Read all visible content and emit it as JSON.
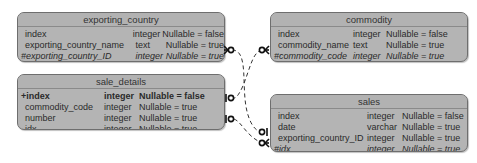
{
  "diagram": {
    "type": "entity-relationship",
    "tables": [
      {
        "name": "exporting_country",
        "columns": [
          {
            "name": "index",
            "type": "integer",
            "nullable": "Nullable = false",
            "style": "normal"
          },
          {
            "name": "exporting_country_name",
            "type": "text",
            "nullable": "Nullable = true",
            "style": "normal"
          },
          {
            "name": "#exporting_country_ID",
            "type": "integer",
            "nullable": "Nullable = true",
            "style": "italic"
          }
        ]
      },
      {
        "name": "sale_details",
        "columns": [
          {
            "name": "+index",
            "type": "integer",
            "nullable": "Nullable = false",
            "style": "bold"
          },
          {
            "name": "commodity_code",
            "type": "integer",
            "nullable": "Nullable = true",
            "style": "normal"
          },
          {
            "name": "number",
            "type": "integer",
            "nullable": "Nullable = true",
            "style": "normal"
          },
          {
            "name": "idx",
            "type": "integer",
            "nullable": "Nullable = true",
            "style": "normal"
          }
        ]
      },
      {
        "name": "commodity",
        "columns": [
          {
            "name": "index",
            "type": "integer",
            "nullable": "Nullable = false",
            "style": "normal"
          },
          {
            "name": "commodity_name",
            "type": "text",
            "nullable": "Nullable = true",
            "style": "normal"
          },
          {
            "name": "#commodity_code",
            "type": "integer",
            "nullable": "Nullable = true",
            "style": "italic"
          }
        ]
      },
      {
        "name": "sales",
        "columns": [
          {
            "name": "index",
            "type": "integer",
            "nullable": "Nullable = false",
            "style": "normal"
          },
          {
            "name": "date",
            "type": "varchar",
            "nullable": "Nullable = true",
            "style": "normal"
          },
          {
            "name": "exporting_country_ID",
            "type": "integer",
            "nullable": "Nullable = true",
            "style": "normal"
          },
          {
            "name": "#idx",
            "type": "integer",
            "nullable": "Nullable = true",
            "style": "italic"
          }
        ]
      }
    ],
    "relationships": [
      {
        "from": "exporting_country.#exporting_country_ID",
        "from_end": "zero-or-many",
        "to": "sales.exporting_country_ID",
        "to_end": "zero-or-one",
        "line": "dashed"
      },
      {
        "from": "commodity.#commodity_code",
        "from_end": "zero-or-many",
        "to": "sale_details.commodity_code",
        "to_end": "zero-or-one",
        "line": "dashed"
      },
      {
        "from": "sales.#idx",
        "from_end": "zero-or-many",
        "to": "sale_details.idx",
        "to_end": "zero-or-one",
        "line": "dashed"
      }
    ],
    "colors": {
      "table_fill": "#b4b4b4",
      "table_border": "#6e6e6e",
      "connector": "#333333",
      "background": "#ffffff"
    }
  }
}
